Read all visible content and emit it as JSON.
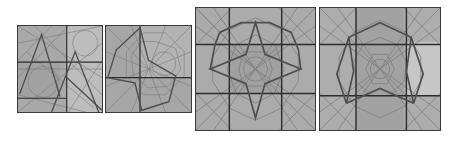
{
  "figure": {
    "colors": {
      "background": "#ffffff",
      "tile_fill": "#a8a8a8",
      "tile_fill_light": "#c4c4c4",
      "grid_line": "#2e2e2e",
      "construction_line": "#7a7a7a",
      "highlight_line": "#505050"
    },
    "panels": [
      {
        "id": "panel-1",
        "grid": "3x3",
        "highlight": "two-triangles"
      },
      {
        "id": "panel-2",
        "grid": "2x2",
        "highlight": "four-point-star-half"
      },
      {
        "id": "panel-3",
        "grid": "3x3",
        "highlight": "four-point-star-octagon"
      },
      {
        "id": "panel-4",
        "grid": "3x3",
        "highlight": "pentagon-arch"
      }
    ]
  }
}
